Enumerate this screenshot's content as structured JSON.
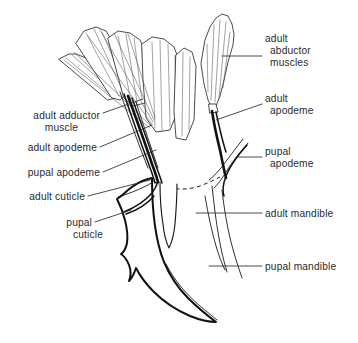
{
  "figure": {
    "background_color": "#ffffff",
    "ink_color": "#111111",
    "text_color": "#2a2a2a"
  },
  "labels": {
    "adult_abductor_muscles": {
      "line1": "adult",
      "line2": "abductor",
      "line3": "muscles"
    },
    "adult_apodeme_right": {
      "line1": "adult",
      "line2": "apodeme"
    },
    "pupal_apodeme_right": {
      "line1": "pupal",
      "line2": "apodeme"
    },
    "adult_mandible": {
      "line1": "adult mandible"
    },
    "pupal_mandible": {
      "line1": "pupal mandible"
    },
    "adult_adductor_muscle": {
      "line1": "adult adductor",
      "line2": "muscle"
    },
    "adult_apodeme_left": {
      "line1": "adult apodeme"
    },
    "pupal_apodeme_left": {
      "line1": "pupal apodeme"
    },
    "adult_cuticle": {
      "line1": "adult  cuticle"
    },
    "pupal_cuticle": {
      "line1": "pupal",
      "line2": "cuticle"
    }
  }
}
